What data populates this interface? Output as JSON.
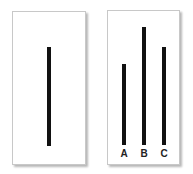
{
  "reference_card": {
    "line": {
      "x": 47,
      "top": 47,
      "bottom": 146
    }
  },
  "comparison_card": {
    "lines": [
      {
        "label": "A",
        "x": 122,
        "top": 64,
        "bottom": 145
      },
      {
        "label": "B",
        "x": 142,
        "top": 27,
        "bottom": 145
      },
      {
        "label": "C",
        "x": 162,
        "top": 47,
        "bottom": 145
      }
    ]
  }
}
